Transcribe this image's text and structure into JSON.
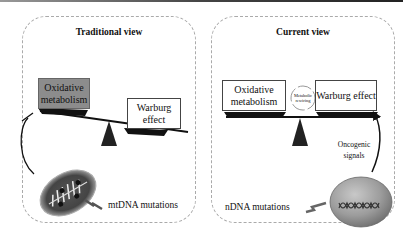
{
  "top_strip": true,
  "left_panel": {
    "title": "Traditional view",
    "heavy_box": "Oxidative metabolism",
    "light_box": "Warburg effect",
    "mutation_label": "mtDNA mutations",
    "organelle": "mitochondrion"
  },
  "right_panel": {
    "title": "Current view",
    "left_box": "Oxidative metabolism",
    "circle_label": "Metabolic rewiring",
    "right_box": "Warburg effect",
    "arrow_label": "Oncogenic signals",
    "mutation_label": "nDNA mutations",
    "organelle": "nucleus"
  },
  "colors": {
    "heavy_box": "#8c8c8c",
    "light_box": "#ffffff",
    "fulcrum": "#222222",
    "nucleus": "#9a9a9a"
  }
}
